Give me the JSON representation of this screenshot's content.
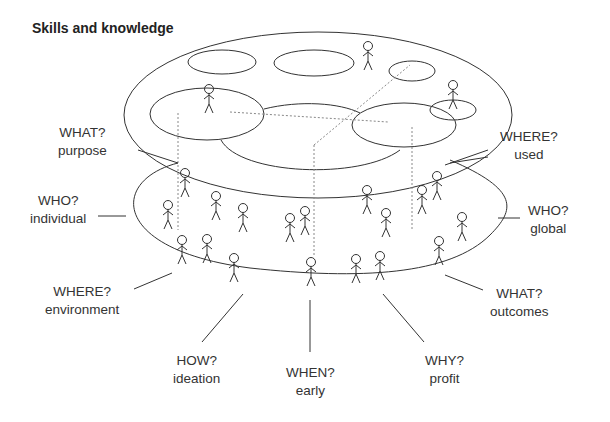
{
  "title": "Skills and knowledge",
  "labels": [
    {
      "id": "what-purpose",
      "q": "WHAT?",
      "a": "purpose",
      "x": 90,
      "y": 122
    },
    {
      "id": "where-used",
      "q": "WHERE?",
      "a": "used",
      "x": 226,
      "y": 128
    },
    {
      "id": "who-individual",
      "q": "WHO?",
      "a": "individual",
      "x": 60,
      "y": 202
    },
    {
      "id": "who-global",
      "q": "WHO?",
      "a": "global",
      "x": 530,
      "y": 202
    },
    {
      "id": "where-environment",
      "q": "WHERE?",
      "a": "environment",
      "x": 86,
      "y": 287
    },
    {
      "id": "what-outcomes",
      "q": "WHAT?",
      "a": "outcomes",
      "x": 522,
      "y": 287
    },
    {
      "id": "how-ideation",
      "q": "HOW?",
      "a": "ideation",
      "x": 197,
      "y": 352
    },
    {
      "id": "when-early",
      "q": "WHEN?",
      "a": "early",
      "x": 310,
      "y": 364
    },
    {
      "id": "why-profit",
      "q": "WHY?",
      "a": "profit",
      "x": 427,
      "y": 352
    }
  ],
  "colors": {
    "line": "#333333",
    "dotted": "#888888",
    "text": "#333333"
  }
}
